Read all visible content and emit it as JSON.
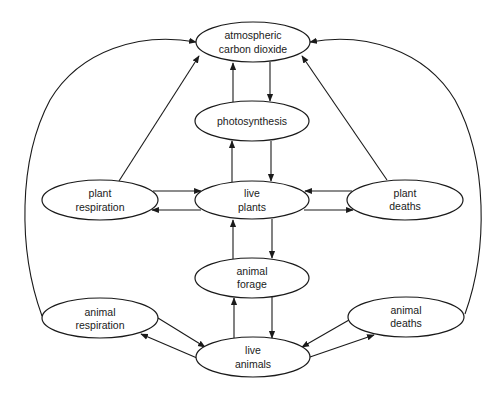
{
  "diagram": {
    "colors": {
      "stroke": "#1a1a1a",
      "fill": "#ffffff",
      "background": "#ffffff"
    },
    "nodes": {
      "co2": {
        "line1": "atmospheric",
        "line2": "carbon dioxide",
        "cx": 253,
        "cy": 42,
        "rx": 57,
        "ry": 20
      },
      "photosynthesis": {
        "line1": "photosynthesis",
        "cx": 252,
        "cy": 121,
        "rx": 57,
        "ry": 20
      },
      "plant_respiration": {
        "line1": "plant",
        "line2": "respiration",
        "cx": 100,
        "cy": 200,
        "rx": 58,
        "ry": 20
      },
      "live_plants": {
        "line1": "live",
        "line2": "plants",
        "cx": 252,
        "cy": 200,
        "rx": 57,
        "ry": 19
      },
      "plant_deaths": {
        "line1": "plant",
        "line2": "deaths",
        "cx": 405,
        "cy": 200,
        "rx": 58,
        "ry": 20
      },
      "animal_forage": {
        "line1": "animal",
        "line2": "forage",
        "cx": 252,
        "cy": 278,
        "rx": 57,
        "ry": 20
      },
      "animal_respiration": {
        "line1": "animal",
        "line2": "respiration",
        "cx": 100,
        "cy": 318,
        "rx": 58,
        "ry": 20
      },
      "live_animals": {
        "line1": "live",
        "line2": "animals",
        "cx": 253,
        "cy": 357,
        "rx": 57,
        "ry": 20
      },
      "animal_deaths": {
        "line1": "animal",
        "line2": "deaths",
        "cx": 406,
        "cy": 317,
        "rx": 58,
        "ry": 20
      }
    },
    "edges": [
      {
        "from": "photosynthesis",
        "to": "co2"
      },
      {
        "from": "co2",
        "to": "photosynthesis"
      },
      {
        "from": "live_plants",
        "to": "photosynthesis"
      },
      {
        "from": "photosynthesis",
        "to": "live_plants"
      },
      {
        "from": "plant_respiration",
        "to": "live_plants"
      },
      {
        "from": "live_plants",
        "to": "plant_respiration"
      },
      {
        "from": "plant_deaths",
        "to": "live_plants"
      },
      {
        "from": "live_plants",
        "to": "plant_deaths"
      },
      {
        "from": "plant_respiration",
        "to": "co2"
      },
      {
        "from": "plant_deaths",
        "to": "co2"
      },
      {
        "from": "animal_forage",
        "to": "live_plants"
      },
      {
        "from": "live_plants",
        "to": "animal_forage"
      },
      {
        "from": "live_animals",
        "to": "animal_forage"
      },
      {
        "from": "animal_forage",
        "to": "live_animals"
      },
      {
        "from": "animal_respiration",
        "to": "live_animals"
      },
      {
        "from": "live_animals",
        "to": "animal_respiration"
      },
      {
        "from": "animal_deaths",
        "to": "live_animals"
      },
      {
        "from": "live_animals",
        "to": "animal_deaths"
      },
      {
        "from": "animal_respiration",
        "to": "co2"
      },
      {
        "from": "animal_deaths",
        "to": "co2"
      }
    ]
  }
}
